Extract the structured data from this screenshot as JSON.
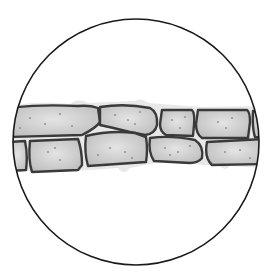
{
  "figure": {
    "subject": "Plant epidermal cells viewed through a microscope",
    "view": "circular field of view",
    "colors": {
      "background": "#ffffff",
      "outline": "#1a1a1a",
      "cell_wall": "#3a3a3a",
      "cytoplasm": "#c9c9c9",
      "cytoplasm_light": "#e2e2e2",
      "granule": "#8a8a8a"
    },
    "cell_count_visible": 12
  }
}
